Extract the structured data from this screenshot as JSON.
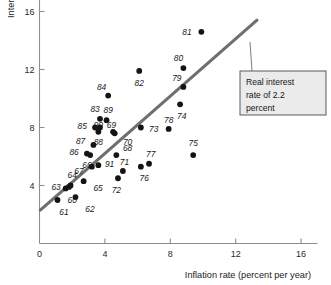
{
  "chart_data": {
    "type": "scatter",
    "title": "",
    "xlabel": "Inflation rate (percent per year)",
    "ylabel": "Interest rate (percent per year)",
    "xlim": [
      0,
      17
    ],
    "ylim": [
      0,
      17
    ],
    "xticks": [
      0,
      4,
      8,
      12,
      16
    ],
    "yticks": [
      4,
      8,
      12,
      16
    ],
    "xtick_labels": [
      "0",
      "4",
      "8",
      "12",
      "16"
    ],
    "ytick_labels": [
      "4",
      "8",
      "12",
      "16"
    ],
    "grid": false,
    "legend": "none",
    "point_label_field": "year",
    "points": [
      {
        "year": "60",
        "x": 1.6,
        "y": 3.8,
        "lx": 2.0,
        "ly": 3.0,
        "anchor": "middle"
      },
      {
        "year": "61",
        "x": 1.1,
        "y": 3.0,
        "lx": 1.5,
        "ly": 2.2,
        "anchor": "middle"
      },
      {
        "year": "62",
        "x": 2.2,
        "y": 3.2,
        "lx": 2.8,
        "ly": 2.4,
        "anchor": "start"
      },
      {
        "year": "63",
        "x": 1.8,
        "y": 3.9,
        "lx": 1.3,
        "ly": 3.9,
        "anchor": "end"
      },
      {
        "year": "64",
        "x": 1.9,
        "y": 4.0,
        "lx": 2.0,
        "ly": 4.7,
        "anchor": "middle"
      },
      {
        "year": "65",
        "x": 2.7,
        "y": 4.3,
        "lx": 3.3,
        "ly": 3.8,
        "anchor": "start"
      },
      {
        "year": "66",
        "x": 3.1,
        "y": 6.1,
        "lx": 2.9,
        "ly": 5.4,
        "anchor": "middle"
      },
      {
        "year": "67",
        "x": 3.2,
        "y": 5.3,
        "lx": 2.7,
        "ly": 5.0,
        "anchor": "end"
      },
      {
        "year": "68",
        "x": 4.7,
        "y": 6.1,
        "lx": 5.1,
        "ly": 6.6,
        "anchor": "start"
      },
      {
        "year": "69",
        "x": 4.5,
        "y": 7.7,
        "lx": 4.4,
        "ly": 8.2,
        "anchor": "middle"
      },
      {
        "year": "70",
        "x": 4.6,
        "y": 7.6,
        "lx": 5.1,
        "ly": 7.0,
        "anchor": "start"
      },
      {
        "year": "71",
        "x": 5.1,
        "y": 5.0,
        "lx": 5.2,
        "ly": 5.6,
        "anchor": "middle"
      },
      {
        "year": "72",
        "x": 4.8,
        "y": 4.5,
        "lx": 4.7,
        "ly": 3.7,
        "anchor": "middle"
      },
      {
        "year": "73",
        "x": 6.2,
        "y": 8.0,
        "lx": 6.7,
        "ly": 7.9,
        "anchor": "start"
      },
      {
        "year": "74",
        "x": 8.6,
        "y": 9.6,
        "lx": 8.7,
        "ly": 8.8,
        "anchor": "middle"
      },
      {
        "year": "75",
        "x": 9.4,
        "y": 6.1,
        "lx": 9.4,
        "ly": 6.9,
        "anchor": "middle"
      },
      {
        "year": "76",
        "x": 6.2,
        "y": 5.3,
        "lx": 6.4,
        "ly": 4.5,
        "anchor": "middle"
      },
      {
        "year": "77",
        "x": 6.7,
        "y": 5.5,
        "lx": 6.8,
        "ly": 6.2,
        "anchor": "middle"
      },
      {
        "year": "78",
        "x": 7.9,
        "y": 7.9,
        "lx": 7.9,
        "ly": 8.5,
        "anchor": "middle"
      },
      {
        "year": "79",
        "x": 8.8,
        "y": 10.8,
        "lx": 8.4,
        "ly": 11.4,
        "anchor": "middle"
      },
      {
        "year": "80",
        "x": 8.8,
        "y": 12.1,
        "lx": 8.5,
        "ly": 12.8,
        "anchor": "middle"
      },
      {
        "year": "81",
        "x": 9.9,
        "y": 14.6,
        "lx": 9.3,
        "ly": 14.6,
        "anchor": "end"
      },
      {
        "year": "82",
        "x": 6.1,
        "y": 11.9,
        "lx": 6.1,
        "ly": 11.1,
        "anchor": "middle"
      },
      {
        "year": "83",
        "x": 3.7,
        "y": 8.6,
        "lx": 3.4,
        "ly": 9.3,
        "anchor": "middle"
      },
      {
        "year": "84",
        "x": 4.2,
        "y": 10.2,
        "lx": 3.8,
        "ly": 10.8,
        "anchor": "middle"
      },
      {
        "year": "85",
        "x": 3.4,
        "y": 8.0,
        "lx": 2.9,
        "ly": 8.1,
        "anchor": "end"
      },
      {
        "year": "86",
        "x": 2.9,
        "y": 6.2,
        "lx": 2.4,
        "ly": 6.3,
        "anchor": "end"
      },
      {
        "year": "87",
        "x": 3.3,
        "y": 6.8,
        "lx": 2.8,
        "ly": 7.1,
        "anchor": "end"
      },
      {
        "year": "88",
        "x": 3.6,
        "y": 7.7,
        "lx": 3.6,
        "ly": 7.0,
        "anchor": "middle"
      },
      {
        "year": "89",
        "x": 4.1,
        "y": 8.5,
        "lx": 4.2,
        "ly": 9.2,
        "anchor": "middle"
      },
      {
        "year": "90",
        "x": 3.7,
        "y": 8.0,
        "lx": 3.6,
        "ly": 8.2,
        "anchor": "middle"
      },
      {
        "year": "91",
        "x": 3.6,
        "y": 5.4,
        "lx": 4.0,
        "ly": 5.5,
        "anchor": "start"
      }
    ],
    "trend_line": {
      "label": "Real interest rate of 2.2 percent",
      "x0": 0.05,
      "y0": 2.3,
      "x1": 13.3,
      "y1": 15.4
    },
    "annotation": {
      "lines": [
        "Real interest",
        "rate of 2.2",
        "percent"
      ],
      "text": "Real interest rate of 2.2 percent"
    }
  },
  "colors": {
    "dot": "#141414",
    "trend": "#6f6f6f",
    "axis": "#8e8e8e",
    "callout_fill": "#ebebeb",
    "callout_border": "#4a4a4a",
    "background": "#ffffff"
  }
}
